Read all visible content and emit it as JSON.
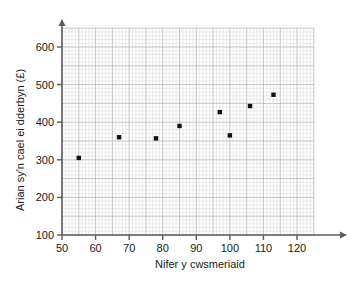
{
  "chart_data": {
    "type": "scatter",
    "title": "",
    "xlabel": "Nifer y cwsmeriaid",
    "ylabel": "Arian sy'n cael ei dderbyn (£)",
    "xlim": [
      50,
      125
    ],
    "ylim": [
      100,
      650
    ],
    "xticks": [
      50,
      60,
      70,
      80,
      90,
      100,
      110,
      120
    ],
    "yticks": [
      100,
      200,
      300,
      400,
      500,
      600
    ],
    "xtick_labels": [
      "50",
      "60",
      "70",
      "80",
      "90",
      "100",
      "110",
      "120"
    ],
    "ytick_labels": [
      "100",
      "200",
      "300",
      "400",
      "500",
      "600"
    ],
    "grid": true,
    "grid_minor_step_x": 1,
    "grid_minor_step_y": 10,
    "grid_major_step_x": 5,
    "grid_major_step_y": 50,
    "legend": null,
    "marker": "square",
    "marker_color": "#111111",
    "points": [
      {
        "x": 55,
        "y": 305
      },
      {
        "x": 67,
        "y": 360
      },
      {
        "x": 78,
        "y": 357
      },
      {
        "x": 85,
        "y": 390
      },
      {
        "x": 97,
        "y": 427
      },
      {
        "x": 100,
        "y": 365
      },
      {
        "x": 106,
        "y": 443
      },
      {
        "x": 113,
        "y": 473
      }
    ]
  },
  "colors": {
    "background": "#ffffff",
    "axis": "#5c5c60",
    "grid_minor": "#d8d8dc",
    "grid_major": "#b6b6bd",
    "marker": "#111111",
    "text": "#1a1a1a"
  }
}
